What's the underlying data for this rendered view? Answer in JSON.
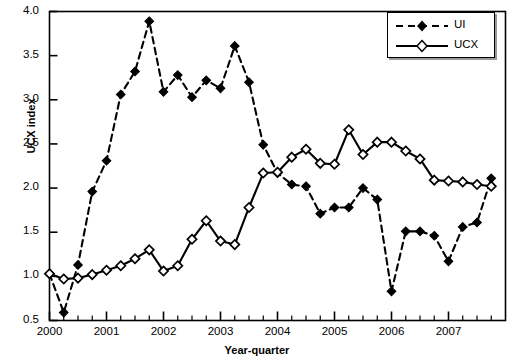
{
  "chart_data": {
    "type": "line",
    "title": "",
    "xlabel": "Year-quarter",
    "ylabel": "UCX index",
    "xlim": [
      2000,
      2008
    ],
    "ylim": [
      0.5,
      4.0
    ],
    "yticks": [
      "0.5",
      "1.0",
      "1.5",
      "2.0",
      "2.5",
      "3.0",
      "3.5",
      "4.0"
    ],
    "ytick_values": [
      0.5,
      1.0,
      1.5,
      2.0,
      2.5,
      3.0,
      3.5,
      4.0
    ],
    "xticks": [
      "2000",
      "2001",
      "2002",
      "2003",
      "2004",
      "2005",
      "2006",
      "2007"
    ],
    "xtick_values": [
      2000,
      2001,
      2002,
      2003,
      2004,
      2005,
      2006,
      2007
    ],
    "minor_xticks_per_year": 4,
    "grid": false,
    "legend_position": "top-right",
    "x": [
      2000.0,
      2000.25,
      2000.5,
      2000.75,
      2001.0,
      2001.25,
      2001.5,
      2001.75,
      2002.0,
      2002.25,
      2002.5,
      2002.75,
      2003.0,
      2003.25,
      2003.5,
      2003.75,
      2004.0,
      2004.25,
      2004.5,
      2004.75,
      2005.0,
      2005.25,
      2005.5,
      2005.75,
      2006.0,
      2006.25,
      2006.5,
      2006.75,
      2007.0,
      2007.25,
      2007.5,
      2007.75
    ],
    "x_labels": [
      "2000Q1",
      "2000Q2",
      "2000Q3",
      "2000Q4",
      "2001Q1",
      "2001Q2",
      "2001Q3",
      "2001Q4",
      "2002Q1",
      "2002Q2",
      "2002Q3",
      "2002Q4",
      "2003Q1",
      "2003Q2",
      "2003Q3",
      "2003Q4",
      "2004Q1",
      "2004Q2",
      "2004Q3",
      "2004Q4",
      "2005Q1",
      "2005Q2",
      "2005Q3",
      "2005Q4",
      "2006Q1",
      "2006Q2",
      "2006Q3",
      "2006Q4",
      "2007Q1",
      "2007Q2",
      "2007Q3",
      "2007Q4"
    ],
    "series": [
      {
        "name": "UI",
        "marker": "filled-diamond",
        "linestyle": "dashed",
        "color": "#000000",
        "values": [
          1.03,
          0.59,
          1.13,
          1.96,
          2.31,
          3.06,
          3.32,
          3.89,
          3.09,
          3.28,
          3.03,
          3.22,
          3.13,
          3.61,
          3.2,
          2.49,
          2.17,
          2.04,
          2.02,
          1.71,
          1.78,
          1.78,
          2.0,
          1.87,
          0.83,
          1.51,
          1.51,
          1.46,
          1.17,
          1.56,
          1.61,
          2.11
        ]
      },
      {
        "name": "UCX",
        "marker": "open-diamond",
        "linestyle": "solid",
        "color": "#000000",
        "values": [
          1.03,
          0.97,
          0.98,
          1.02,
          1.07,
          1.12,
          1.2,
          1.3,
          1.06,
          1.12,
          1.42,
          1.63,
          1.4,
          1.36,
          1.78,
          2.17,
          2.18,
          2.35,
          2.44,
          2.28,
          2.27,
          2.66,
          2.38,
          2.52,
          2.52,
          2.42,
          2.33,
          2.09,
          2.08,
          2.07,
          2.04,
          2.02
        ]
      }
    ]
  },
  "legend": {
    "items": [
      {
        "label": "UI"
      },
      {
        "label": "UCX"
      }
    ]
  }
}
